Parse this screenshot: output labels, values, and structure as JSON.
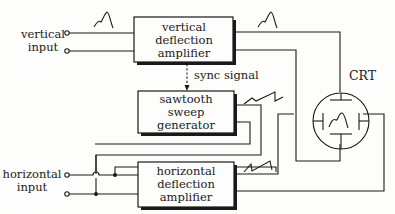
{
  "diagram": {
    "blocks": {
      "vertical_amp": {
        "lines": [
          "vertical",
          "deflection",
          "amplifier"
        ]
      },
      "sawtooth": {
        "lines": [
          "sawtooth",
          "sweep",
          "generator"
        ]
      },
      "horizontal_amp": {
        "lines": [
          "horizontal",
          "deflection",
          "amplifier"
        ]
      }
    },
    "inputs": {
      "vertical": {
        "lines": [
          "vertical",
          "input"
        ]
      },
      "horizontal": {
        "lines": [
          "horizontal",
          "input"
        ]
      }
    },
    "labels": {
      "sync": "sync signal",
      "crt": "CRT"
    },
    "colors": {
      "ink": "#1a1a1a",
      "background": "#fdfdfb"
    }
  }
}
